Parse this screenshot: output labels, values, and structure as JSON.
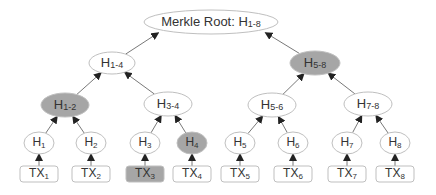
{
  "diagram": {
    "colors": {
      "highlight": "#a6a6a6",
      "node_fill": "#ffffff",
      "stroke": "#bfbfbf",
      "arrow": "#222222",
      "text": "#333333"
    },
    "root": {
      "id": "root",
      "prefix": "Merkle Root: H",
      "sub": "1-8",
      "highlighted": false
    },
    "level1": [
      {
        "id": "h1-4",
        "prefix": "H",
        "sub": "1-4",
        "highlighted": false
      },
      {
        "id": "h5-8",
        "prefix": "H",
        "sub": "5-8",
        "highlighted": true
      }
    ],
    "level2": [
      {
        "id": "h1-2",
        "prefix": "H",
        "sub": "1-2",
        "highlighted": true
      },
      {
        "id": "h3-4",
        "prefix": "H",
        "sub": "3-4",
        "highlighted": false
      },
      {
        "id": "h5-6",
        "prefix": "H",
        "sub": "5-6",
        "highlighted": false
      },
      {
        "id": "h7-8",
        "prefix": "H",
        "sub": "7-8",
        "highlighted": false
      }
    ],
    "leaves": [
      {
        "id": "h1",
        "prefix": "H",
        "sub": "1",
        "highlighted": false
      },
      {
        "id": "h2",
        "prefix": "H",
        "sub": "2",
        "highlighted": false
      },
      {
        "id": "h3",
        "prefix": "H",
        "sub": "3",
        "highlighted": false
      },
      {
        "id": "h4",
        "prefix": "H",
        "sub": "4",
        "highlighted": true
      },
      {
        "id": "h5",
        "prefix": "H",
        "sub": "5",
        "highlighted": false
      },
      {
        "id": "h6",
        "prefix": "H",
        "sub": "6",
        "highlighted": false
      },
      {
        "id": "h7",
        "prefix": "H",
        "sub": "7",
        "highlighted": false
      },
      {
        "id": "h8",
        "prefix": "H",
        "sub": "8",
        "highlighted": false
      }
    ],
    "transactions": [
      {
        "id": "tx1",
        "prefix": "TX",
        "sub": "1",
        "highlighted": false
      },
      {
        "id": "tx2",
        "prefix": "TX",
        "sub": "2",
        "highlighted": false
      },
      {
        "id": "tx3",
        "prefix": "TX",
        "sub": "3",
        "highlighted": true
      },
      {
        "id": "tx4",
        "prefix": "TX",
        "sub": "4",
        "highlighted": false
      },
      {
        "id": "tx5",
        "prefix": "TX",
        "sub": "5",
        "highlighted": false
      },
      {
        "id": "tx6",
        "prefix": "TX",
        "sub": "6",
        "highlighted": false
      },
      {
        "id": "tx7",
        "prefix": "TX",
        "sub": "7",
        "highlighted": false
      },
      {
        "id": "tx8",
        "prefix": "TX",
        "sub": "8",
        "highlighted": false
      }
    ]
  }
}
